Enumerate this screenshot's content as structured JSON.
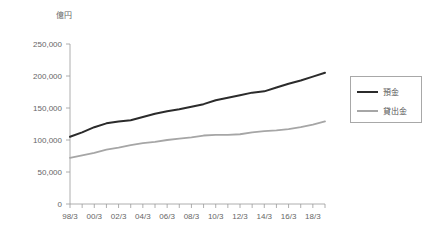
{
  "chart_data": {
    "type": "line",
    "title": "",
    "subtitle": "",
    "unit_label": "億円",
    "xlabel": "",
    "ylabel": "",
    "ylim": [
      0,
      250000
    ],
    "xlim": [
      "98/3",
      "19/3"
    ],
    "grid": false,
    "legend_position": "right",
    "y_ticks": [
      0,
      50000,
      100000,
      150000,
      200000,
      250000
    ],
    "y_tick_labels": [
      "0",
      "50,000",
      "100,000",
      "150,000",
      "200,000",
      "250,000"
    ],
    "x": [
      "98/3",
      "99/3",
      "00/3",
      "01/3",
      "02/3",
      "03/3",
      "04/3",
      "05/3",
      "06/3",
      "07/3",
      "08/3",
      "09/3",
      "10/3",
      "11/3",
      "12/3",
      "13/3",
      "14/3",
      "15/3",
      "16/3",
      "17/3",
      "18/3",
      "19/3"
    ],
    "x_tick_labels": [
      "98/3",
      "00/3",
      "02/3",
      "04/3",
      "06/3",
      "08/3",
      "10/3",
      "12/3",
      "14/3",
      "16/3",
      "18/3"
    ],
    "x_tick_label_interval": 2,
    "series": [
      {
        "name": "預金",
        "color": "#2b2b2b",
        "values": [
          105000,
          112000,
          120000,
          126000,
          129000,
          131000,
          136000,
          141000,
          145000,
          148000,
          152000,
          156000,
          162000,
          166000,
          170000,
          174000,
          176000,
          182000,
          188000,
          193000,
          199000,
          205000
        ]
      },
      {
        "name": "貸出金",
        "color": "#a6a6a6",
        "values": [
          72000,
          76000,
          80000,
          85000,
          88000,
          92000,
          95000,
          97000,
          100000,
          102000,
          104000,
          107000,
          108000,
          108000,
          109000,
          112000,
          114000,
          115000,
          117000,
          120000,
          124000,
          129000
        ]
      }
    ]
  }
}
